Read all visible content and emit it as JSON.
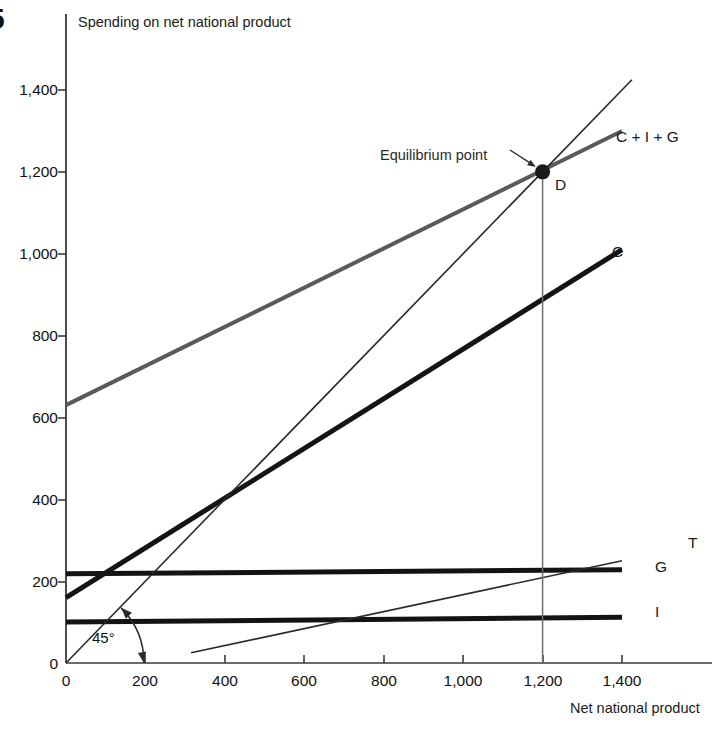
{
  "figure": {
    "number": "5",
    "equilibrium_annotation": "Equilibrium point",
    "equilibrium_point_label": "D",
    "angle_label": "45°"
  },
  "chart_data": {
    "type": "line",
    "title": "",
    "xlabel": "Net national product",
    "ylabel": "Spending on net national product",
    "xlim": [
      0,
      1500
    ],
    "ylim": [
      0,
      1500
    ],
    "xticks": [
      0,
      200,
      400,
      600,
      800,
      1000,
      1200,
      1400
    ],
    "xtick_labels": [
      "0",
      "200",
      "400",
      "600",
      "800",
      "1,000",
      "1,200",
      "1,400"
    ],
    "yticks": [
      0,
      200,
      400,
      600,
      800,
      1000,
      1200,
      1400
    ],
    "ytick_labels": [
      "0",
      "200",
      "400",
      "600",
      "800",
      "1,000",
      "1,200",
      "1,400"
    ],
    "grid": false,
    "legend_position": "right-of-line-ends",
    "series": [
      {
        "name": "C + I + G",
        "label": "C + I + G",
        "color": "#5a5a5a",
        "width": 4,
        "x": [
          0,
          1400
        ],
        "y": [
          630,
          1300
        ]
      },
      {
        "name": "C",
        "label": "C",
        "color": "#141414",
        "width": 5,
        "x": [
          0,
          1400
        ],
        "y": [
          160,
          1010
        ]
      },
      {
        "name": "G",
        "label": "G",
        "color": "#141414",
        "width": 5,
        "x": [
          0,
          1400
        ],
        "y": [
          218,
          228
        ]
      },
      {
        "name": "I",
        "label": "I",
        "color": "#141414",
        "width": 5,
        "x": [
          0,
          1400
        ],
        "y": [
          100,
          112
        ]
      },
      {
        "name": "T",
        "label": "T",
        "color": "#2a2a2a",
        "width": 1.6,
        "x": [
          315,
          1400
        ],
        "y": [
          25,
          250
        ]
      },
      {
        "name": "45-degree-line",
        "label": "",
        "color": "#2a2a2a",
        "width": 1.6,
        "x": [
          0,
          1425
        ],
        "y": [
          0,
          1425
        ]
      }
    ],
    "equilibrium": {
      "x": 1200,
      "y": 1200,
      "label": "D"
    },
    "annotations": [
      {
        "text": "Equilibrium point",
        "x": 1200,
        "y": 1200
      },
      {
        "text": "45°",
        "x": 110,
        "y": 60
      }
    ]
  }
}
